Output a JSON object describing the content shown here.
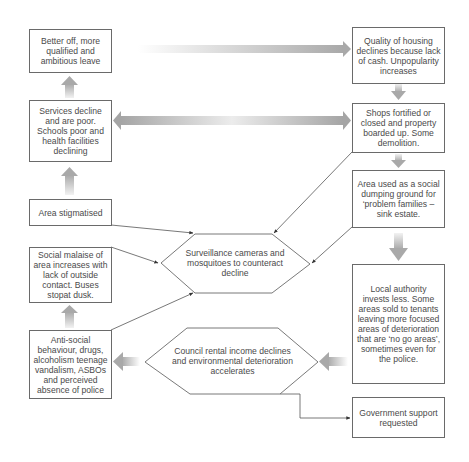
{
  "diagram": {
    "title": "",
    "nodes": {
      "better_off": "Better off, more qualified and ambitious leave",
      "services": "Services decline and are poor. Schools poor and health facilities declining",
      "stigmatised": "Area stigmatised",
      "social_malaise": "Social malaise of area increases with lack of outside contact. Buses stopat dusk.",
      "anti_social": "Anti-social behaviour, drugs, alcoholism teenage vandalism, ASBOs and perceived absence of police",
      "quality_housing": "Quality of housing declines because lack of cash. Unpopularity increases",
      "shops": "Shops fortified or closed and property boarded up. Some demolition.",
      "dumping": "Area used as a social dumping ground for ‘problem families – sink estate.",
      "local_authority": "Local authority invests less. Some areas sold to tenants leaving more focused areas of deterioration that are ‘no go areas’, sometimes even for the police.",
      "government": "Government support requested",
      "surveillance": "Surveillance cameras and mosquitoes to counteract decline",
      "council_rental": "Council rental income declines and environmental deterioration accelerates"
    },
    "edges": [
      {
        "from": "better_off",
        "to": "quality_housing",
        "style": "gradient-block-arrow"
      },
      {
        "from": "quality_housing",
        "to": "shops",
        "style": "gradient-block-arrow"
      },
      {
        "from": "shops",
        "to": "services",
        "style": "gradient-double-arrow"
      },
      {
        "from": "shops",
        "to": "dumping",
        "style": "gradient-block-arrow"
      },
      {
        "from": "dumping",
        "to": "local_authority",
        "style": "gradient-block-arrow"
      },
      {
        "from": "local_authority",
        "to": "council_rental",
        "style": "gradient-block-arrow"
      },
      {
        "from": "council_rental",
        "to": "anti_social",
        "style": "gradient-block-arrow"
      },
      {
        "from": "council_rental",
        "to": "government",
        "style": "elbow-line-arrow"
      },
      {
        "from": "anti_social",
        "to": "social_malaise",
        "style": "gradient-block-arrow"
      },
      {
        "from": "stigmatised",
        "to": "services",
        "style": "gradient-block-arrow"
      },
      {
        "from": "services",
        "to": "better_off",
        "style": "gradient-block-arrow"
      },
      {
        "from": "stigmatised",
        "to": "surveillance",
        "style": "line-arrow"
      },
      {
        "from": "social_malaise",
        "to": "surveillance",
        "style": "line-arrow"
      },
      {
        "from": "anti_social",
        "to": "surveillance",
        "style": "line-arrow"
      },
      {
        "from": "shops",
        "to": "surveillance",
        "style": "line-arrow"
      },
      {
        "from": "dumping",
        "to": "surveillance",
        "style": "line-arrow"
      }
    ],
    "colors": {
      "border": "#6a6a6a",
      "text": "#4a4a4a",
      "arrow_dark": "#a8a8a8",
      "arrow_light": "#eeeeee"
    }
  }
}
